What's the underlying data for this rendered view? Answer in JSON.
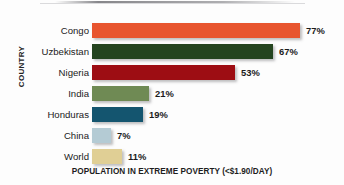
{
  "chart_data": {
    "type": "bar",
    "orientation": "horizontal",
    "title": "",
    "subtitle": "",
    "xlabel": "POPULATION IN EXTREME POVERTY (<$1.90/DAY)",
    "ylabel": "COUNTRY",
    "categories": [
      "Congo",
      "Uzbekistan",
      "Nigeria",
      "India",
      "Honduras",
      "China",
      "World"
    ],
    "values": [
      77,
      67,
      53,
      21,
      19,
      7,
      11
    ],
    "value_labels": [
      "77%",
      "67%",
      "53%",
      "21%",
      "19%",
      "7%",
      "11%"
    ],
    "unit": "%",
    "xlim": [
      0,
      77
    ],
    "grid": false,
    "legend": "none",
    "bar_colors": [
      "#e8552f",
      "#24441f",
      "#9d0d13",
      "#6f8a54",
      "#14556f",
      "#b4cbd4",
      "#e0cf95"
    ],
    "series": [
      {
        "name": "Population in extreme poverty",
        "values": [
          77,
          67,
          53,
          21,
          19,
          7,
          11
        ]
      }
    ],
    "points": [
      {
        "category": "Congo",
        "value": 77,
        "label": "77%",
        "color": "#e8552f"
      },
      {
        "category": "Uzbekistan",
        "value": 67,
        "label": "67%",
        "color": "#24441f"
      },
      {
        "category": "Nigeria",
        "value": 53,
        "label": "53%",
        "color": "#9d0d13"
      },
      {
        "category": "India",
        "value": 21,
        "label": "21%",
        "color": "#6f8a54"
      },
      {
        "category": "Honduras",
        "value": 19,
        "label": "19%",
        "color": "#14556f"
      },
      {
        "category": "China",
        "value": 7,
        "label": "7%",
        "color": "#b4cbd4"
      },
      {
        "category": "World",
        "value": 11,
        "label": "11%",
        "color": "#e0cf95"
      }
    ]
  },
  "axis": {
    "y_title": "COUNTRY",
    "x_title": "POPULATION IN EXTREME POVERTY (<$1.90/DAY)"
  }
}
